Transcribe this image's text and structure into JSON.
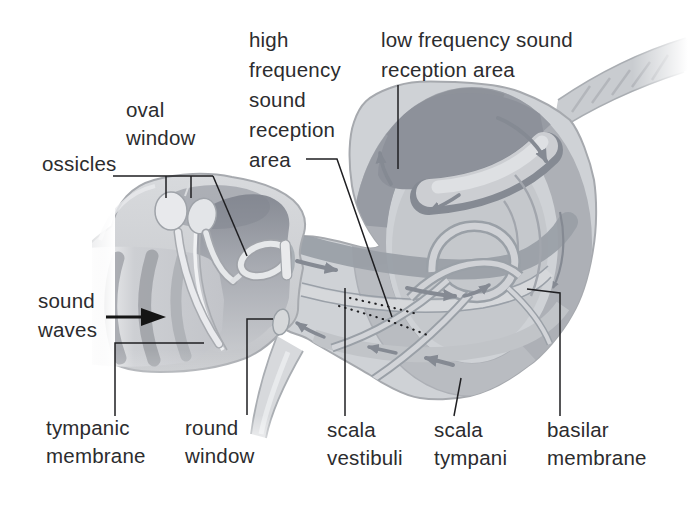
{
  "figure": {
    "labels": {
      "high_frequency": "high\nfrequency\nsound\nreception\narea",
      "low_frequency": "low frequency sound\nreception area",
      "oval_window": "oval\nwindow",
      "ossicles": "ossicles",
      "sound_waves": "sound\nwaves",
      "tympanic_membrane": "tympanic\nmembrane",
      "round_window": "round\nwindow",
      "scala_vestibuli": "scala\nvestibuli",
      "scala_tympani": "scala\ntympani",
      "basilar_membrane": "basilar\nmembrane"
    },
    "icons": {
      "sound_direction_arrow": "black right-pointing arrow",
      "flow_arrows": "gray curved arrows showing wave path through cochlea"
    },
    "colors": {
      "background": "#ffffff",
      "body_light": "#cfd2d6",
      "body_mid": "#aaadb3",
      "body_dark": "#8d919a",
      "bone_light": "#e9eaec",
      "arrow_gray": "#858a93",
      "text": "#2c2c2e",
      "leader": "#1f1f22"
    }
  }
}
